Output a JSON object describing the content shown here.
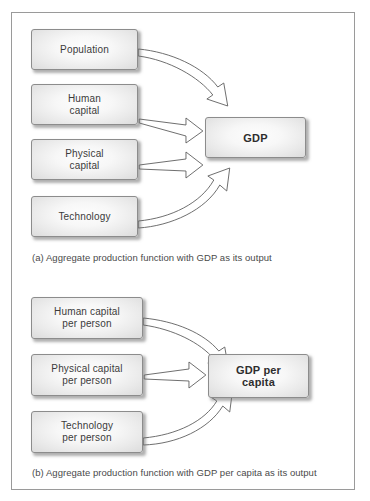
{
  "figure": {
    "panels": [
      {
        "id": "panel-a",
        "caption": "(a) Aggregate production function with GDP as its output",
        "inputs": [
          {
            "line1": "Population",
            "line2": ""
          },
          {
            "line1": "Human",
            "line2": "capital"
          },
          {
            "line1": "Physical",
            "line2": "capital"
          },
          {
            "line1": "Technology",
            "line2": ""
          }
        ],
        "output": {
          "line1": "GDP",
          "line2": ""
        }
      },
      {
        "id": "panel-b",
        "caption": "(b) Aggregate production function with GDP per capita as its output",
        "inputs": [
          {
            "line1": "Human capital",
            "line2": "per person"
          },
          {
            "line1": "Physical capital",
            "line2": "per person"
          },
          {
            "line1": "Technology",
            "line2": "per person"
          }
        ],
        "output": {
          "line1": "GDP per",
          "line2": "capita"
        }
      }
    ],
    "colors": {
      "frame_border": "#9a9a9a",
      "box_border": "#8c8c8c",
      "box_fill_light": "#fdfdfd",
      "box_fill_dark": "#dcdcdc",
      "text": "#3b3b3b",
      "arrow_stroke": "#5e5e5e",
      "arrow_fill": "#ffffff",
      "caption_text": "#4a4a4a",
      "page_background": "#ffffff"
    }
  }
}
